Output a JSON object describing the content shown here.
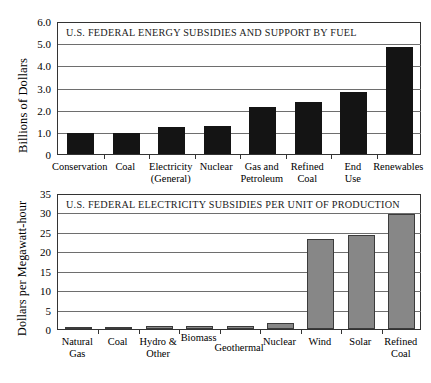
{
  "chart_data": [
    {
      "type": "bar",
      "title": "U.S. FEDERAL ENERGY SUBSIDIES AND SUPPORT BY FUEL",
      "ylabel": "Billions of Dollars",
      "xlabel": "",
      "ylim": [
        0,
        6.0
      ],
      "yticks": [
        "0",
        "1.0",
        "2.0",
        "3.0",
        "4.0",
        "5.0",
        "6.0"
      ],
      "ytick_values": [
        0,
        1,
        2,
        3,
        4,
        5,
        6
      ],
      "grid": true,
      "legend": "none",
      "bar_color": "#141414",
      "categories": [
        "Conservation",
        "Coal",
        "Electricity (General)",
        "Nuclear",
        "Gas and Petroleum",
        "Refined Coal",
        "End Use",
        "Renewables"
      ],
      "category_lines": [
        [
          "Conservation",
          ""
        ],
        [
          "Coal",
          ""
        ],
        [
          "Electricity",
          "(General)"
        ],
        [
          "Nuclear",
          ""
        ],
        [
          "Gas and",
          "Petroleum"
        ],
        [
          "Refined",
          "Coal"
        ],
        [
          "End",
          "Use"
        ],
        [
          "Renewables",
          ""
        ]
      ],
      "values": [
        0.93,
        0.93,
        1.2,
        1.25,
        2.12,
        2.34,
        2.8,
        4.82
      ]
    },
    {
      "type": "bar",
      "title": "U.S. FEDERAL ELECTRICITY SUBSIDIES PER UNIT OF PRODUCTION",
      "ylabel": "Dollars per Megawatt-hour",
      "xlabel": "",
      "ylim": [
        0,
        35
      ],
      "yticks": [
        "0",
        "5",
        "10",
        "15",
        "20",
        "25",
        "30",
        "35"
      ],
      "ytick_values": [
        0,
        5,
        10,
        15,
        20,
        25,
        30,
        35
      ],
      "grid": true,
      "legend": "none",
      "bar_color": "#878787",
      "categories": [
        "Natural Gas",
        "Coal",
        "Hydro & Other",
        "Biomass",
        "Geothermal",
        "Nuclear",
        "Wind",
        "Solar",
        "Refined Coal"
      ],
      "category_lines": [
        [
          "Natural",
          "Gas"
        ],
        [
          "Coal",
          ""
        ],
        [
          "Hydro &",
          "Other"
        ],
        [
          "Biomass",
          ""
        ],
        [
          "Geothermal",
          ""
        ],
        [
          "Nuclear",
          ""
        ],
        [
          "Wind",
          ""
        ],
        [
          "Solar",
          ""
        ],
        [
          "Refined",
          "Coal"
        ]
      ],
      "values": [
        0.2,
        0.35,
        0.8,
        0.72,
        0.72,
        1.5,
        23.2,
        24.1,
        29.7
      ]
    }
  ]
}
